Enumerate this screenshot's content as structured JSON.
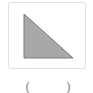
{
  "tile": {
    "shape": "right-triangle",
    "fill_color": "#a8a8a8",
    "stroke_color": "#7a7a7a",
    "border_color": "#e2e2e2"
  },
  "caption": {
    "open": "(",
    "close": ")"
  }
}
